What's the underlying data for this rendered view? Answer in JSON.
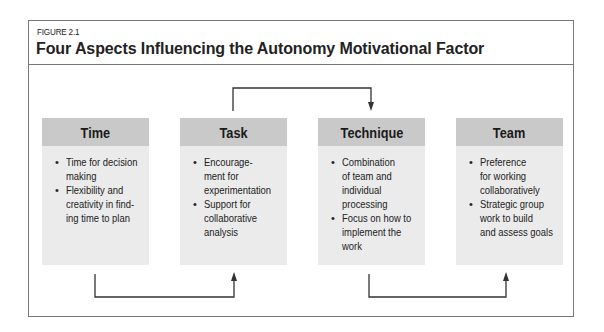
{
  "figure": {
    "label": "FIGURE 2.1",
    "title": "Four Aspects Influencing the Autonomy Motivational Factor"
  },
  "boxes": [
    {
      "heading": "Time",
      "items": [
        "Time for decision\nmaking",
        "Flexibility and\ncreativity in find-\ning time to plan"
      ]
    },
    {
      "heading": "Task",
      "items": [
        "Encourage-\nment for\nexperimentation",
        "Support for\ncollaborative\nanalysis"
      ]
    },
    {
      "heading": "Technique",
      "items": [
        "Combination\nof team and\nindividual\nprocessing",
        "Focus on how to\nimplement the\nwork"
      ]
    },
    {
      "heading": "Team",
      "items": [
        "Preference\nfor working\ncollaboratively",
        "Strategic group\nwork to build\nand assess goals"
      ]
    }
  ],
  "connectors": [
    {
      "from": "Time",
      "to": "Task",
      "route": "below"
    },
    {
      "from": "Task",
      "to": "Technique",
      "route": "above"
    },
    {
      "from": "Technique",
      "to": "Team",
      "route": "below"
    }
  ],
  "colors": {
    "header_bg": "#c9c9c9",
    "body_bg": "#ebebeb",
    "frame": "#777777",
    "arrow": "#333333"
  },
  "bullet": "•"
}
